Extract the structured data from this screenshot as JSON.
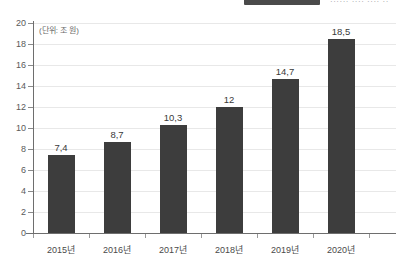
{
  "header": {
    "clipped_text": "······ ···· ···· ··",
    "note": "partially cropped header strip at top edge"
  },
  "chart_data": {
    "type": "bar",
    "title": "",
    "unit_note": "(단위: 조 원)",
    "xlabel": "",
    "ylabel": "",
    "categories": [
      "2015년",
      "2016년",
      "2017년",
      "2018년",
      "2019년",
      "2020년"
    ],
    "values": [
      7.4,
      8.7,
      10.3,
      12,
      14.7,
      18.5
    ],
    "value_labels": [
      "7,4",
      "8,7",
      "10,3",
      "12",
      "14,7",
      "18,5"
    ],
    "ylim": [
      0,
      20
    ],
    "ytick_step": 2,
    "yticks": [
      0,
      2,
      4,
      6,
      8,
      10,
      12,
      14,
      16,
      18,
      20
    ],
    "ytick_labels": [
      "0",
      "2",
      "4",
      "6",
      "8",
      "10",
      "12",
      "14",
      "16",
      "18",
      "20"
    ],
    "grid": true,
    "grid_axis": "y",
    "legend": "none",
    "bar_color": "#3d3d3d",
    "grid_color": "#e8e8e8",
    "axis_color": "#6e6e6e",
    "background": "#ffffff"
  }
}
